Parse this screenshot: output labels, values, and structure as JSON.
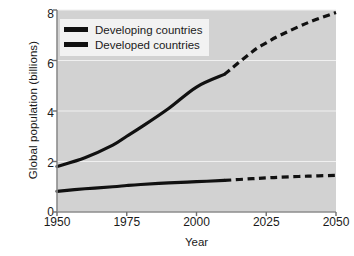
{
  "chart_data": {
    "type": "line",
    "title": "",
    "xlabel": "Year",
    "ylabel": "Global population (billions)",
    "xlim": [
      1950,
      2050
    ],
    "ylim": [
      0,
      8
    ],
    "xticks": [
      1950,
      1975,
      2000,
      2025,
      2050
    ],
    "xtick_labels": [
      "1950",
      "1975",
      "2000",
      "2025",
      "2050"
    ],
    "yticks": [
      0,
      2,
      4,
      6,
      8
    ],
    "ytick_labels": [
      "0",
      "2",
      "4",
      "6",
      "8"
    ],
    "grid": "horizontal-gridlines-white",
    "legend_position": "top-left-inside",
    "plot_background": "#d2d2d2",
    "figure_background": "#ffffff",
    "line_color": "#111111",
    "historical_end_year": 2010,
    "projection_note": "dashed segments are projections after 2010",
    "series": [
      {
        "name": "Developing countries",
        "style": "solid-then-dashed",
        "x": [
          1950,
          1960,
          1970,
          1975,
          1980,
          1990,
          2000,
          2010,
          2020,
          2025,
          2030,
          2040,
          2050
        ],
        "values": [
          1.8,
          2.15,
          2.65,
          3.0,
          3.35,
          4.1,
          4.95,
          5.45,
          6.35,
          6.7,
          7.0,
          7.5,
          7.9
        ]
      },
      {
        "name": "Developed countries",
        "style": "solid-then-dashed",
        "x": [
          1950,
          1960,
          1970,
          1975,
          1980,
          1990,
          2000,
          2010,
          2020,
          2025,
          2030,
          2040,
          2050
        ],
        "values": [
          0.82,
          0.92,
          1.0,
          1.05,
          1.09,
          1.15,
          1.2,
          1.25,
          1.32,
          1.35,
          1.38,
          1.42,
          1.45
        ]
      }
    ]
  },
  "legend": {
    "items": [
      {
        "label": "Developing countries"
      },
      {
        "label": "Developed countries"
      }
    ]
  }
}
